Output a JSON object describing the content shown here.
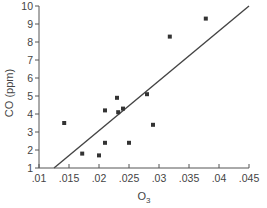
{
  "chart_data": {
    "type": "scatter",
    "title": "",
    "xlabel": "O3",
    "xlabel_main": "O",
    "xlabel_sub": "3",
    "ylabel": "CO (ppm)",
    "xlim": [
      0.01,
      0.045
    ],
    "ylim": [
      1,
      10
    ],
    "x_ticks": [
      0.01,
      0.015,
      0.02,
      0.025,
      0.03,
      0.035,
      0.04,
      0.045
    ],
    "x_tick_labels": [
      ".01",
      ".015",
      ".02",
      ".025",
      ".03",
      ".035",
      ".04",
      ".045"
    ],
    "y_ticks": [
      1,
      2,
      3,
      4,
      5,
      6,
      7,
      8,
      9,
      10
    ],
    "y_tick_labels": [
      "1",
      "2",
      "3",
      "4",
      "5",
      "6",
      "7",
      "8",
      "9",
      "10"
    ],
    "grid": false,
    "legend": null,
    "series": [
      {
        "name": "observations",
        "marker": "square",
        "color": "#333333",
        "points": [
          {
            "x": 0.0142,
            "y": 3.5
          },
          {
            "x": 0.0172,
            "y": 1.8
          },
          {
            "x": 0.02,
            "y": 1.7
          },
          {
            "x": 0.021,
            "y": 2.4
          },
          {
            "x": 0.021,
            "y": 4.2
          },
          {
            "x": 0.023,
            "y": 4.9
          },
          {
            "x": 0.0232,
            "y": 4.1
          },
          {
            "x": 0.024,
            "y": 4.3
          },
          {
            "x": 0.025,
            "y": 2.4
          },
          {
            "x": 0.028,
            "y": 5.1
          },
          {
            "x": 0.029,
            "y": 3.4
          },
          {
            "x": 0.0318,
            "y": 8.3
          },
          {
            "x": 0.0378,
            "y": 9.3
          }
        ]
      }
    ],
    "fit_line": {
      "name": "least-squares fit",
      "color": "#444444",
      "start": {
        "x": 0.0125,
        "y": 1.0
      },
      "end": {
        "x": 0.045,
        "y": 10.0
      }
    }
  }
}
